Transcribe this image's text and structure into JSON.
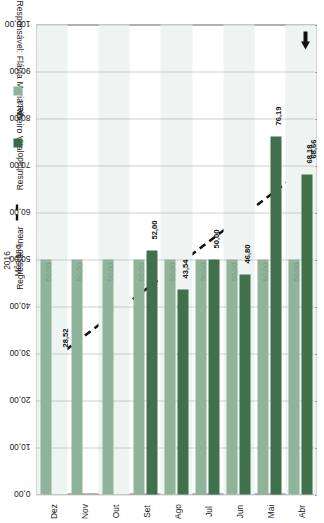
{
  "header": {
    "responsible_label": "Responsável: Flávia Maria Ribeiro Vital"
  },
  "marker": {
    "arrow_icon": "left-arrow-icon"
  },
  "axis": {
    "category_title_line1": "Mês/ano",
    "category_title_line2": "2016",
    "value_ticks": [
      "100,00",
      "90,00",
      "80,00",
      "70,00",
      "60,00",
      "50,00",
      "40,00",
      "30,00",
      "20,00",
      "10,00",
      "0,00"
    ]
  },
  "legend": {
    "items": [
      {
        "label": "Meta",
        "type": "swatch",
        "color": "#8fb49a",
        "name": "legend-meta"
      },
      {
        "label": "Resultado",
        "type": "swatch",
        "color": "#3b6b46",
        "name": "legend-resultado"
      },
      {
        "label": "Regressão linear",
        "type": "dashed-line",
        "color": "#111111",
        "name": "legend-regressao-linear"
      }
    ]
  },
  "chart_data": {
    "type": "bar",
    "title": "",
    "xlabel": "Mês/ano 2016",
    "ylabel": "",
    "ylim": [
      0,
      100
    ],
    "grid": true,
    "legend_position": "right",
    "categories": [
      "Abr",
      "Mai",
      "Jun",
      "Jul",
      "Ago",
      "Set",
      "Out",
      "Nov",
      "Dez"
    ],
    "series": [
      {
        "name": "Meta",
        "color": "#8fb49a",
        "values": [
          50.0,
          50.0,
          50.0,
          50.0,
          50.0,
          50.0,
          50.0,
          50.0,
          50.0
        ],
        "labels": [
          "50,00",
          "50,00",
          "50,00",
          "50,00",
          "50,00",
          "50,00",
          "50,00",
          "50,00",
          "50,00"
        ]
      },
      {
        "name": "Resultado",
        "color": "#41714a",
        "values": [
          68.18,
          76.19,
          46.8,
          50.0,
          43.54,
          52.0,
          null,
          null,
          null
        ],
        "labels": [
          "68,18",
          "76,19",
          "46,80",
          "50,00",
          "43,54",
          "52,00",
          "",
          "",
          ""
        ]
      }
    ],
    "trendline": {
      "name": "Regressão linear",
      "style": "dashed",
      "color": "#111111",
      "start": {
        "category": "Abr",
        "value": 68.66,
        "label": "68,66"
      },
      "end": {
        "category": "Dez",
        "value": 28.52,
        "label": "28,52"
      }
    }
  }
}
